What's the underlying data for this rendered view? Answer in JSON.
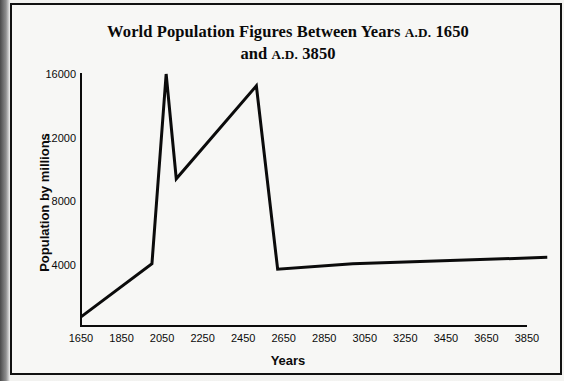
{
  "figure": {
    "title_line1_main": "World Population Figures Between Years ",
    "title_line1_smallcaps": "A.D.",
    "title_line1_year": " 1650",
    "title_line2_main": "and ",
    "title_line2_smallcaps": "A.D.",
    "title_line2_year": " 3850",
    "title_plain": "World Population Figures Between Years A.D. 1650 and A.D. 3850",
    "frame_color": "#111111",
    "page_color": "#f7f7f5",
    "ink_color": "#0b0b0b"
  },
  "chart_data": {
    "type": "line",
    "title": "World Population Figures Between Years A.D. 1650 and A.D. 3850",
    "xlabel": "Years",
    "ylabel": "Population by millions",
    "xlim": [
      1650,
      3850
    ],
    "ylim": [
      0,
      16000
    ],
    "grid": false,
    "legend": false,
    "xticks": [
      1650,
      1850,
      2050,
      2250,
      2450,
      2650,
      2850,
      3050,
      3250,
      3450,
      3650,
      3850
    ],
    "xtick_labels": [
      "1650",
      "1850",
      "2050",
      "2250",
      "2450",
      "2650",
      "2850",
      "3050",
      "3250",
      "3450",
      "3650",
      "3850"
    ],
    "yticks": [
      4000,
      8000,
      12000,
      16000
    ],
    "ytick_labels": [
      "4000",
      "8000",
      "12000",
      "16000"
    ],
    "series": [
      {
        "name": "World population",
        "color": "#0b0b0b",
        "line_width": 3,
        "x": [
          1650,
          2000,
          2070,
          2120,
          2515,
          2620,
          2990,
          3950
        ],
        "y": [
          700,
          4050,
          16000,
          9400,
          15250,
          3700,
          4050,
          4450
        ],
        "points": [
          {
            "year": 1650,
            "population": 700
          },
          {
            "year": 2000,
            "population": 4050
          },
          {
            "year": 2070,
            "population": 16000
          },
          {
            "year": 2120,
            "population": 9400
          },
          {
            "year": 2515,
            "population": 15250
          },
          {
            "year": 2620,
            "population": 3700
          },
          {
            "year": 2990,
            "population": 4050
          },
          {
            "year": 3950,
            "population": 4450
          }
        ]
      }
    ]
  }
}
